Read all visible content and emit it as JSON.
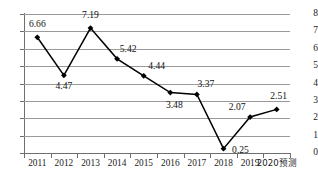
{
  "chart_data": {
    "type": "line",
    "title": "",
    "xlabel": "",
    "ylabel": "",
    "categories": [
      "2011",
      "2012",
      "2013",
      "2014",
      "2015",
      "2016",
      "2017",
      "2018",
      "2019",
      "2020预测"
    ],
    "values": [
      6.66,
      4.47,
      7.19,
      5.42,
      4.44,
      3.48,
      3.37,
      0.25,
      2.07,
      2.51
    ],
    "point_labels": [
      "6.66",
      "4.47",
      "7.19",
      "5.42",
      "4.44",
      "3.48",
      "3.37",
      "0.25",
      "2.07",
      "2.51"
    ],
    "ylim": [
      0,
      8
    ],
    "y_ticks": [
      "0",
      "1",
      "2",
      "3",
      "4",
      "5",
      "6",
      "7",
      "8"
    ],
    "grid": true,
    "legend": "none",
    "marker": "diamond",
    "line_color": "#000000",
    "grid_color": "#9a9a9a",
    "axis_color": "#6e6e6e",
    "label_color": "#111111",
    "label_placement": [
      "above",
      "below",
      "above",
      "above",
      "above",
      "below",
      "above",
      "right",
      "left-above",
      "above"
    ]
  }
}
